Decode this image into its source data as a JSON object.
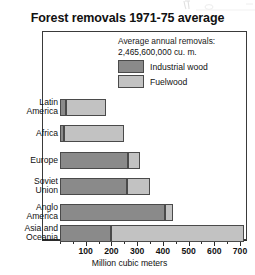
{
  "chart_data": {
    "type": "bar",
    "orientation": "horizontal",
    "stacked": true,
    "title": "Forest removals 1971-75 average",
    "xlabel": "Million cubic meters",
    "ylabel": "",
    "xlim": [
      0,
      760
    ],
    "xticks": [
      100,
      200,
      300,
      400,
      500,
      600,
      700
    ],
    "xtick_labels": [
      "100",
      "200",
      "300",
      "400",
      "500",
      "600",
      "700"
    ],
    "minor_tick_step": 50,
    "grid": false,
    "legend_position": "inside-top-right",
    "annotation_lines": [
      "Average annual removals:",
      "2,465,600,000 cu. m."
    ],
    "categories": [
      "Latin America",
      "Africa",
      "Europe",
      "Soviet Union",
      "Anglo America",
      "Asia and Oceania"
    ],
    "category_label_lines": [
      [
        "Latin",
        "America"
      ],
      [
        "Africa"
      ],
      [
        "Europe"
      ],
      [
        "Soviet",
        "Union"
      ],
      [
        "Anglo",
        "America"
      ],
      [
        "Asia and",
        "Oceania"
      ]
    ],
    "series": [
      {
        "name": "Industrial wood",
        "color": "#8a8a8a",
        "values": [
          25,
          15,
          265,
          260,
          410,
          200
        ]
      },
      {
        "name": "Fuelwood",
        "color": "#c2c2c2",
        "values": [
          155,
          235,
          45,
          90,
          30,
          515
        ]
      }
    ],
    "totals": [
      180,
      250,
      310,
      350,
      440,
      715
    ]
  },
  "legend": {
    "caption_line1": "Average annual removals:",
    "caption_line2": "2,465,600,000 cu. m.",
    "items": [
      {
        "label": "Industrial wood",
        "color": "#8a8a8a"
      },
      {
        "label": "Fuelwood",
        "color": "#c2c2c2"
      }
    ]
  }
}
